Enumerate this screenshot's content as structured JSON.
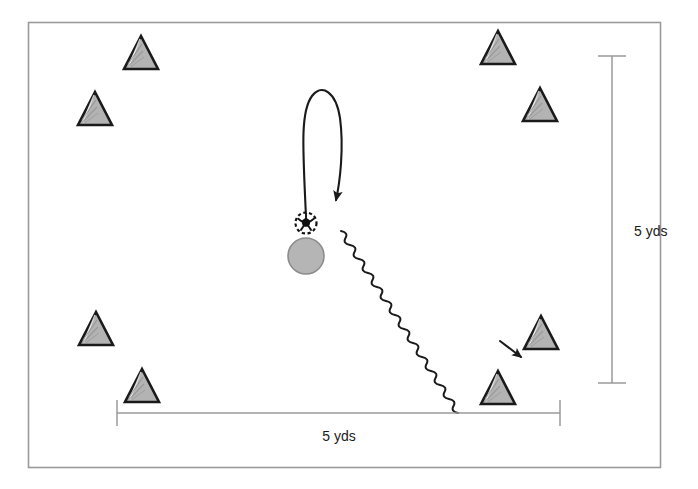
{
  "diagram": {
    "colors": {
      "background": "#ffffff",
      "frame_border": "#9a9a9a",
      "cone_fill": "#b3b3b3",
      "cone_outline": "#1a1a1a",
      "player_fill": "#b5b5b5",
      "player_outline": "#8c8c8c",
      "ball_fill": "#ffffff",
      "ball_outline": "#111111",
      "path_stroke": "#1a1a1a",
      "dimension_stroke": "#9a9a9a",
      "label_text": "#1a1a1a"
    },
    "frame": {
      "x": 28,
      "y": 22,
      "width": 632,
      "height": 445
    },
    "cones": [
      {
        "id": "cone-top-left-inner",
        "label": "cone",
        "x": 141,
        "y": 56
      },
      {
        "id": "cone-top-left-outer",
        "label": "cone",
        "x": 95,
        "y": 112
      },
      {
        "id": "cone-top-right-inner",
        "label": "cone",
        "x": 498,
        "y": 51
      },
      {
        "id": "cone-top-right-outer",
        "label": "cone",
        "x": 540,
        "y": 108
      },
      {
        "id": "cone-bottom-left-outer",
        "label": "cone",
        "x": 96,
        "y": 332
      },
      {
        "id": "cone-bottom-left-inner",
        "label": "cone",
        "x": 142,
        "y": 389
      },
      {
        "id": "cone-bottom-right-outer",
        "label": "cone",
        "x": 541,
        "y": 336
      },
      {
        "id": "cone-bottom-right-inner",
        "label": "cone",
        "x": 498,
        "y": 391
      }
    ],
    "player": {
      "id": "player-marker",
      "label": "player",
      "x": 306,
      "y": 256,
      "radius": 18
    },
    "ball": {
      "id": "ball-marker",
      "label": "ball",
      "x": 306,
      "y": 223,
      "radius": 11
    },
    "paths": [
      {
        "id": "turn-path",
        "label": "turn / u-turn run",
        "style": "curved-arrow",
        "start": {
          "x": 306,
          "y": 217
        },
        "end": {
          "x": 336,
          "y": 205
        }
      },
      {
        "id": "dribble-path",
        "label": "dribble with ball",
        "style": "wavy-arrow",
        "start": {
          "x": 340,
          "y": 230
        },
        "end": {
          "x": 525,
          "y": 362
        }
      }
    ],
    "dimensions": [
      {
        "id": "dimension-vertical",
        "label": "5 yds",
        "orientation": "vertical",
        "x": 612,
        "y_start": 56,
        "y_end": 383,
        "label_x": 634,
        "label_y": 231
      },
      {
        "id": "dimension-horizontal",
        "label": "5 yds",
        "orientation": "horizontal",
        "y": 413,
        "x_start": 117,
        "x_end": 560,
        "label_x": 339,
        "label_y": 436
      }
    ]
  }
}
